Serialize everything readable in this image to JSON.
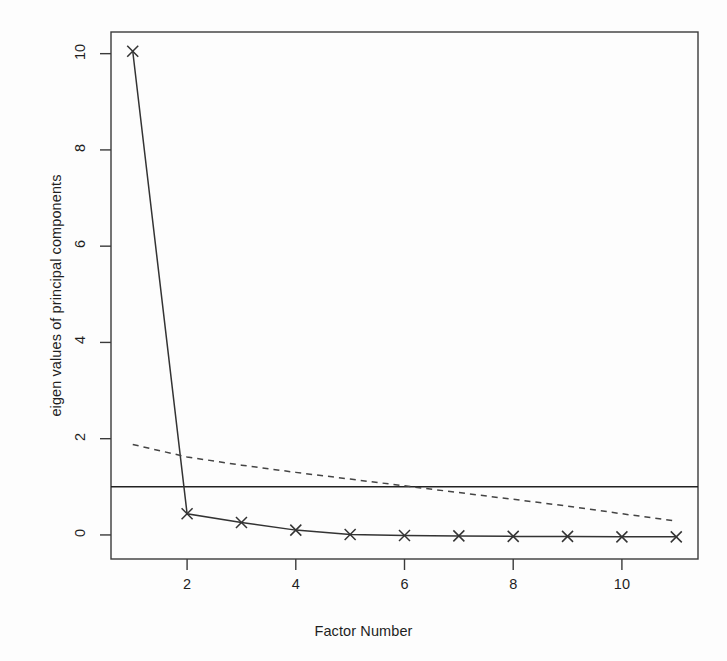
{
  "chart_data": {
    "type": "line",
    "title": "",
    "subtitle": "",
    "xlabel": "Factor Number",
    "ylabel": "eigen values of principal components",
    "x": [
      1,
      2,
      3,
      4,
      5,
      6,
      7,
      8,
      9,
      10,
      11
    ],
    "xlim": [
      0.6,
      11.4
    ],
    "ylim": [
      -0.5,
      10.45
    ],
    "xticks": [
      2,
      4,
      6,
      8,
      10
    ],
    "xtick_labels": [
      "2",
      "4",
      "6",
      "8",
      "10"
    ],
    "yticks": [
      0,
      2,
      4,
      6,
      8,
      10
    ],
    "ytick_labels": [
      "0",
      "2",
      "4",
      "6",
      "8",
      "10"
    ],
    "grid": false,
    "legend": "none",
    "box": true,
    "series": [
      {
        "name": "PC Actual Data",
        "style": "solid",
        "marker": "x",
        "color": "#333333",
        "values": [
          10.05,
          0.44,
          0.26,
          0.1,
          0.01,
          -0.01,
          -0.02,
          -0.03,
          -0.03,
          -0.04,
          -0.04
        ]
      },
      {
        "name": "PC Simulated Data",
        "style": "dashed",
        "marker": "none",
        "color": "#444444",
        "values": [
          1.88,
          1.62,
          1.45,
          1.3,
          1.16,
          1.02,
          0.88,
          0.74,
          0.6,
          0.44,
          0.29
        ]
      }
    ],
    "reference_lines": [
      {
        "name": "eigenvalue-one-criterion",
        "orientation": "horizontal",
        "y": 1.0,
        "style": "solid",
        "color": "#222222"
      }
    ]
  },
  "figure": {
    "background_color": "#fdfdfd",
    "axis_color": "#3a3a3a"
  }
}
